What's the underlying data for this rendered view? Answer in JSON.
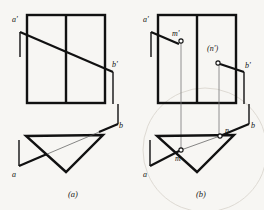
{
  "figure": {
    "background_color": "#f7f6f3",
    "ink_color": "#111111",
    "thin_color": "#555555",
    "panels": [
      {
        "id": "a",
        "caption": "(a)",
        "caption_x": 68,
        "caption_y": 197,
        "labels": [
          {
            "name": "a-prime",
            "text": "a'",
            "x": 12,
            "y": 22
          },
          {
            "name": "b-prime",
            "text": "b'",
            "x": 112,
            "y": 67
          },
          {
            "name": "b",
            "text": "b",
            "x": 119,
            "y": 128
          },
          {
            "name": "a",
            "text": "a",
            "x": 12,
            "y": 177
          }
        ]
      },
      {
        "id": "b",
        "caption": "(b)",
        "caption_x": 196,
        "caption_y": 197,
        "labels": [
          {
            "name": "a-prime",
            "text": "a'",
            "x": 143,
            "y": 22
          },
          {
            "name": "m-prime",
            "text": "m'",
            "x": 172,
            "y": 36
          },
          {
            "name": "n-prime",
            "text": "(n')",
            "x": 209,
            "y": 51
          },
          {
            "name": "b-prime",
            "text": "b'",
            "x": 245,
            "y": 68
          },
          {
            "name": "n",
            "text": "n",
            "x": 226,
            "y": 133
          },
          {
            "name": "b",
            "text": "b",
            "x": 250,
            "y": 128
          },
          {
            "name": "m",
            "text": "m",
            "x": 175,
            "y": 161
          },
          {
            "name": "a",
            "text": "a",
            "x": 143,
            "y": 177
          }
        ],
        "points": [
          {
            "name": "m-prime-point",
            "x": 181,
            "y": 41
          },
          {
            "name": "n-prime-point",
            "x": 218,
            "y": 63
          },
          {
            "name": "n-point",
            "x": 220,
            "y": 136
          },
          {
            "name": "m-point",
            "x": 181,
            "y": 150
          }
        ]
      }
    ],
    "geometry": {
      "panel_a": {
        "front_view_rect": {
          "x": 27,
          "y": 15,
          "w": 78,
          "h": 88,
          "divider_x": 66
        },
        "line_ab_front": {
          "x1": 20,
          "y1": 32,
          "x2": 113,
          "y2": 72
        },
        "stub_a_front": {
          "x": 20,
          "y1": 32,
          "y2": 57
        },
        "stub_b_front": {
          "x": 113,
          "y1": 72,
          "y2": 104
        },
        "top_view_triangle": [
          {
            "x": 26,
            "y": 136
          },
          {
            "x": 103,
            "y": 135
          },
          {
            "x": 66,
            "y": 172
          }
        ],
        "line_ab_top": {
          "x1": 19,
          "y1": 166,
          "x2": 118,
          "y2": 124
        },
        "stub_a_top": {
          "x": 19,
          "y1": 140,
          "y2": 166
        },
        "stub_b_top": {
          "x": 118,
          "y1": 124,
          "y2": 104
        }
      },
      "panel_b": {
        "front_view_rect": {
          "x": 158,
          "y": 15,
          "w": 78,
          "h": 88,
          "divider_x": 197
        },
        "line_ab_front": {
          "x1": 151,
          "y1": 32,
          "x2": 244,
          "y2": 72
        },
        "stub_a_front": {
          "x": 151,
          "y1": 32,
          "y2": 57
        },
        "stub_b_front": {
          "x": 244,
          "y1": 72,
          "y2": 104
        },
        "top_view_triangle": [
          {
            "x": 157,
            "y": 136
          },
          {
            "x": 234,
            "y": 135
          },
          {
            "x": 197,
            "y": 172
          }
        ],
        "line_ab_top": {
          "x1": 150,
          "y1": 166,
          "x2": 249,
          "y2": 124
        },
        "stub_a_top": {
          "x": 150,
          "y1": 140,
          "y2": 166
        },
        "stub_b_top": {
          "x": 249,
          "y1": 124,
          "y2": 104
        },
        "projector_m": {
          "x": 181,
          "y1": 41,
          "y2": 150
        },
        "projector_n": {
          "x": 219,
          "y1": 63,
          "y2": 136
        },
        "background_arc": {
          "cx": 205,
          "cy": 150,
          "r": 62
        }
      }
    }
  }
}
